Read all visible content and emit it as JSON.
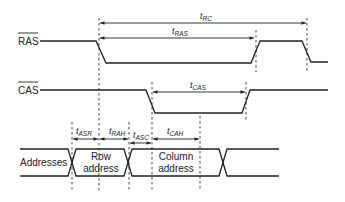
{
  "diagram": {
    "type": "timing-diagram",
    "signals": [
      {
        "name": "RAS",
        "overline": true
      },
      {
        "name": "CAS",
        "overline": true
      },
      {
        "name": "Addresses",
        "overline": false
      }
    ],
    "address_labels": {
      "row_line1": "Row",
      "row_line2": "address",
      "col_line1": "Column",
      "col_line2": "address"
    },
    "timings": {
      "rc": {
        "t": "t",
        "sub": "RC"
      },
      "ras": {
        "t": "t",
        "sub": "RAS"
      },
      "cas": {
        "t": "t",
        "sub": "CAS"
      },
      "asr": {
        "t": "t",
        "sub": "ASR"
      },
      "rah": {
        "t": "t",
        "sub": "RAH"
      },
      "asc": {
        "t": "t",
        "sub": "ASC"
      },
      "cah": {
        "t": "t",
        "sub": "CAH"
      }
    }
  }
}
